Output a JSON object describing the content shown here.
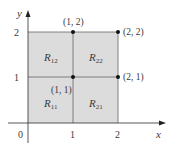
{
  "diagram": {
    "type": "grid-partition",
    "axes": {
      "x_label": "x",
      "y_label": "y",
      "origin_label": "0",
      "x_ticks": [
        "1",
        "2"
      ],
      "y_ticks": [
        "1",
        "2"
      ]
    },
    "regions": [
      {
        "id": "R11",
        "label": "R",
        "sub": "11"
      },
      {
        "id": "R21",
        "label": "R",
        "sub": "21"
      },
      {
        "id": "R12",
        "label": "R",
        "sub": "12"
      },
      {
        "id": "R22",
        "label": "R",
        "sub": "22"
      }
    ],
    "points": [
      {
        "label": "(1, 2)"
      },
      {
        "label": "(2, 2)"
      },
      {
        "label": "(1, 1)"
      },
      {
        "label": "(2, 1)"
      }
    ],
    "colors": {
      "region_fill": "#dcdcdc",
      "line": "#555555",
      "axis": "#444444",
      "point": "#111111",
      "text": "#3a3a3a"
    }
  }
}
